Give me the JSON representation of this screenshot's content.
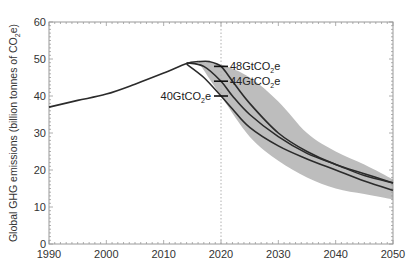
{
  "chart_data": {
    "type": "area",
    "title": "",
    "xlabel": "",
    "ylabel": "Global GHG emissions (billion tonnes of CO2e)",
    "ylabel_parts": {
      "main": "Global GHG emissions (billion tonnes of CO",
      "sub": "2",
      "tail": "e)"
    },
    "xlim": [
      1990,
      2050
    ],
    "ylim": [
      0,
      60
    ],
    "x_ticks": [
      1990,
      2000,
      2010,
      2020,
      2030,
      2040,
      2050
    ],
    "y_ticks": [
      0,
      10,
      20,
      30,
      40,
      50,
      60
    ],
    "grid": false,
    "reference_line": {
      "x": 2020,
      "style": "dotted"
    },
    "series": [
      {
        "name": "Historic emissions",
        "x": [
          1990,
          1995,
          2000,
          2005,
          2010,
          2014,
          2016
        ],
        "values": [
          37,
          38.8,
          40.5,
          43.2,
          46.2,
          48.8,
          49.3
        ]
      },
      {
        "name": "48GtCO2e",
        "x": [
          2016,
          2018,
          2020,
          2022,
          2025,
          2030,
          2035,
          2040,
          2045,
          2050
        ],
        "values": [
          49.3,
          49.3,
          48,
          44,
          38,
          30,
          25,
          21.5,
          19,
          16.5
        ]
      },
      {
        "name": "44GtCO2e",
        "x": [
          2014,
          2017,
          2020,
          2022,
          2025,
          2030,
          2035,
          2040,
          2045,
          2050
        ],
        "values": [
          49,
          48,
          44,
          40,
          35,
          29,
          24.5,
          21.5,
          18.5,
          16.5
        ]
      },
      {
        "name": "40GtCO2e",
        "x": [
          2014,
          2017,
          2020,
          2022,
          2025,
          2030,
          2035,
          2040,
          2045,
          2050
        ],
        "values": [
          48.6,
          45,
          40,
          36.5,
          31.5,
          26.5,
          23,
          20,
          17,
          14.5
        ]
      }
    ],
    "range_band": {
      "name": "Scenario range",
      "x": [
        2016,
        2020,
        2025,
        2030,
        2035,
        2040,
        2045,
        2050
      ],
      "upper": [
        49.3,
        48.5,
        45,
        38.5,
        30,
        25,
        21.5,
        17.5
      ],
      "lower": [
        49.3,
        40,
        29,
        22.5,
        18,
        15,
        13.5,
        12
      ]
    },
    "annotations": [
      {
        "text": "48GtCO2e",
        "main": "48GtCO",
        "sub": "2",
        "tail": "e",
        "x": 2020,
        "y": 48
      },
      {
        "text": "44GtCO2e",
        "main": "44GtCO",
        "sub": "2",
        "tail": "e",
        "x": 2020,
        "y": 44
      },
      {
        "text": "40GtCO2e",
        "main": "40GtCO",
        "sub": "2",
        "tail": "e",
        "x": 2020,
        "y": 40
      }
    ],
    "colors": {
      "line": "#2b2b2b",
      "band": "#bdbdbd",
      "axis": "#9a9a9a",
      "refline": "#b0b0b0"
    }
  }
}
